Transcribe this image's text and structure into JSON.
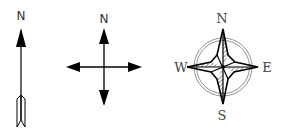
{
  "symbols": [
    {
      "name": "simple-north-arrow",
      "label": "N"
    },
    {
      "name": "four-way-north-arrow",
      "label": "N"
    },
    {
      "name": "compass-rose",
      "labels": {
        "north": "N",
        "south": "S",
        "east": "E",
        "west": "W"
      }
    }
  ],
  "colors": {
    "stroke": "#000000",
    "label": "#333333",
    "ring": "#777777",
    "background": "#ffffff"
  }
}
